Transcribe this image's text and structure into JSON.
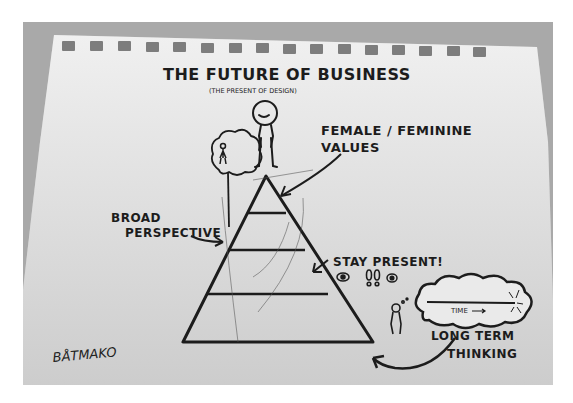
{
  "photo": {
    "subject": "hand-drawn sketch on spiral notepad",
    "background_color": "#a9a9a9",
    "paper_color": "#e9e9e9",
    "ink_color": "#1c1c1c"
  },
  "sketch": {
    "title": "THE FUTURE OF BUSINESS",
    "subtitle": "(THE PRESENT OF DESIGN)",
    "labels": {
      "top": [
        "FEMALE / FEMININE",
        "VALUES"
      ],
      "left": [
        "BROAD",
        "PERSPECTIVE"
      ],
      "middle": "STAY PRESENT!",
      "cloud": "TIME",
      "bottom_right": [
        "LONG TERM",
        "THINKING"
      ]
    },
    "signature": "BÅTMAKO",
    "pyramid": {
      "levels": 4
    },
    "icons": [
      "woman-figure-icon",
      "tree-icon",
      "person-in-tree-icon",
      "eye-icon",
      "footprints-icon",
      "eye-icon",
      "thought-cloud-icon",
      "person-thinking-icon"
    ]
  }
}
